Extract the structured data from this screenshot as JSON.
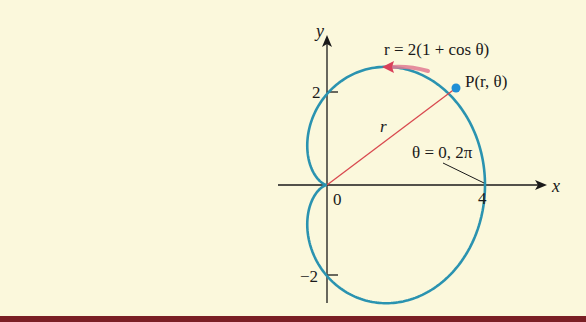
{
  "figure": {
    "equation_label": "r = 2(1 + cos θ)",
    "point_label": "P(r, θ)",
    "radius_label": "r",
    "angle_label": "θ = 0, 2π",
    "x_axis_label": "x",
    "y_axis_label": "y",
    "origin_label": "0",
    "x_tick_labels": [
      "4"
    ],
    "y_tick_labels": [
      "2",
      "−2"
    ],
    "colors": {
      "background": "#fbf8dc",
      "curve": "#2a93b0",
      "radius_line": "#d9494f",
      "arrow": "#e0506a",
      "point": "#1f8fd6",
      "axes": "#1a1a1a",
      "bottom_band": "#7a1f24"
    }
  },
  "chart_data": {
    "type": "line",
    "xlabel": "x",
    "ylabel": "y",
    "polar_equation": "r = 2(1 + cos θ)",
    "x_ticks": [
      0,
      4
    ],
    "y_ticks": [
      -2,
      0,
      2
    ],
    "xlim": [
      -0.5,
      4.5
    ],
    "ylim": [
      -2.8,
      3.0
    ],
    "annotations": [
      "P(r, θ)",
      "θ = 0, 2π",
      "r"
    ],
    "grid": false
  }
}
